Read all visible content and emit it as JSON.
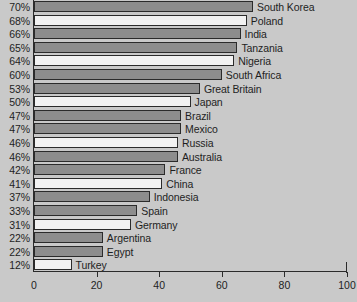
{
  "chart_data": {
    "type": "bar",
    "orientation": "horizontal",
    "title": "",
    "subtitle": "",
    "xlabel": "",
    "ylabel": "",
    "xlim": [
      0,
      100
    ],
    "xticks": [
      0,
      20,
      40,
      60,
      80,
      100
    ],
    "xtick_labels": [
      "0",
      "20",
      "40",
      "60",
      "80",
      "100"
    ],
    "grid": false,
    "legend": "none",
    "value_label_suffix": "%",
    "categories": [
      "South Korea",
      "Poland",
      "India",
      "Tanzania",
      "Nigeria",
      "South Africa",
      "Great Britain",
      "Japan",
      "Brazil",
      "Mexico",
      "Russia",
      "Australia",
      "France",
      "China",
      "Indonesia",
      "Spain",
      "Germany",
      "Argentina",
      "Egypt",
      "Turkey"
    ],
    "values": [
      70,
      68,
      66,
      65,
      64,
      60,
      53,
      50,
      47,
      47,
      46,
      46,
      42,
      41,
      37,
      33,
      31,
      22,
      22,
      12
    ],
    "value_labels": [
      "70%",
      "68%",
      "66%",
      "65%",
      "64%",
      "60%",
      "53%",
      "50%",
      "47%",
      "47%",
      "46%",
      "46%",
      "42%",
      "41%",
      "37%",
      "33%",
      "31%",
      "22%",
      "22%",
      "12%"
    ],
    "bar_fills": [
      "dark",
      "light",
      "dark",
      "dark",
      "light",
      "dark",
      "dark",
      "light",
      "dark",
      "dark",
      "light",
      "dark",
      "dark",
      "light",
      "dark",
      "dark",
      "light",
      "dark",
      "dark",
      "light"
    ],
    "colors": {
      "bar_dark": "#8d8d8d",
      "bar_light": "#f2f2f2",
      "bar_outline": "#2b2b2b",
      "axis": "#2b2b2b",
      "background": "#c9c9c9",
      "text": "#1e1e1e"
    }
  }
}
